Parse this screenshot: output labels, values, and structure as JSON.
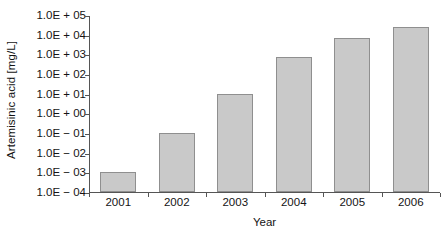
{
  "chart_data": {
    "type": "bar",
    "title": "",
    "xlabel": "Year",
    "ylabel": "Artemisinic acid [mg/L]",
    "categories": [
      "2001",
      "2002",
      "2003",
      "2004",
      "2005",
      "2006"
    ],
    "values": [
      0.001,
      0.1,
      10,
      700,
      7000,
      25000
    ],
    "value_labels": [
      "1.0E-03",
      "1.0E-01",
      "1.0E+01",
      "7.0E+02",
      "7.0E+03",
      "2.5E+04"
    ],
    "yscale": "log",
    "ylim": [
      0.0001,
      100000
    ],
    "ytick_values": [
      100000,
      10000,
      1000,
      100,
      10,
      1,
      0.1,
      0.01,
      0.001,
      0.0001
    ],
    "ytick_labels": [
      "1.0E + 05",
      "1.0E + 04",
      "1.0E + 03",
      "1.0E + 02",
      "1.0E + 01",
      "1.0E + 00",
      "1.0E − 01",
      "1.0E − 02",
      "1.0E − 03",
      "1.0E − 04"
    ],
    "grid": false,
    "legend": null,
    "legend_position": "none",
    "bar_fill_color": "#c9c9c9",
    "bar_border_color": "#8f8f8f",
    "axis_color": "#555555",
    "background_color": "#ffffff",
    "series": [
      {
        "name": "Artemisinic acid titer",
        "values": [
          0.001,
          0.1,
          10,
          700,
          7000,
          25000
        ]
      }
    ]
  }
}
